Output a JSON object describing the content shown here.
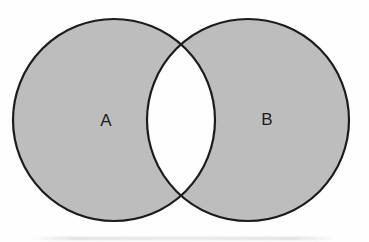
{
  "diagram": {
    "type": "venn",
    "sets": [
      {
        "label": "A"
      },
      {
        "label": "B"
      }
    ],
    "shaded_region": "symmetric difference: both circles shaded, intersection unshaded",
    "colors": {
      "fill": "#bdbdbd",
      "stroke": "#1c1c1c",
      "intersection": "#ffffff",
      "background": "#fefefe",
      "label": "#1d1d1d"
    }
  }
}
